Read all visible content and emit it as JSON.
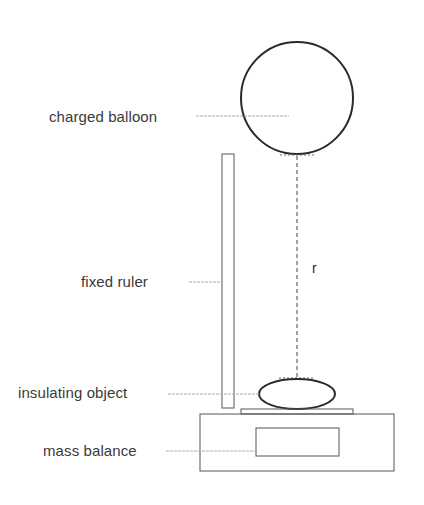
{
  "diagram": {
    "title": "",
    "labels": {
      "charged_balloon": "charged balloon",
      "fixed_ruler": "fixed ruler",
      "insulating_object": "insulating object",
      "mass_balance": "mass balance",
      "distance": "r"
    },
    "colors": {
      "stroke": "#2a2a2a",
      "thin_stroke": "#555555",
      "leader": "#aaaaaa",
      "text": "#3a3a3a",
      "background": "#ffffff"
    }
  }
}
